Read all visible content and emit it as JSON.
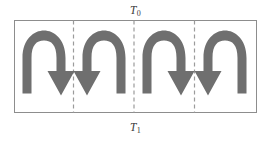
{
  "figure": {
    "type": "diagram",
    "canvas": {
      "width": 271,
      "height": 141,
      "background": "#ffffff"
    }
  },
  "labels": {
    "top": {
      "symbol": "T",
      "subscript": "0",
      "text": "T0",
      "position": "above-box",
      "align": "center"
    },
    "bottom": {
      "symbol": "T",
      "subscript": "1",
      "text": "T1",
      "position": "below-box",
      "align": "center"
    }
  },
  "enclosure": {
    "name": "fluid-layer-box",
    "x": 14,
    "y": 20,
    "width": 243,
    "height": 93,
    "border_color": "#8d8d8d",
    "border_width": 1,
    "fill": "#ffffff"
  },
  "dividers": {
    "style": "dashed",
    "color": "#9b9b9b",
    "width": 1.2,
    "dash_pattern": "4,3",
    "x_positions": [
      73.5,
      134.0,
      194.5
    ],
    "y_top": 20,
    "y_bottom": 113
  },
  "arrows": {
    "fill_color": "#6f6f6f",
    "count": 4,
    "description": "arched convection roll arrows, alternating circulation direction",
    "items": [
      {
        "name": "convection-arrow-1",
        "cell": 1,
        "head_side": "right",
        "direction": "clockwise",
        "center_x": 44,
        "top_y": 37,
        "bottom_y": 95
      },
      {
        "name": "convection-arrow-2",
        "cell": 2,
        "head_side": "left",
        "direction": "counterclockwise",
        "center_x": 104,
        "top_y": 37,
        "bottom_y": 95
      },
      {
        "name": "convection-arrow-3",
        "cell": 3,
        "head_side": "right",
        "direction": "clockwise",
        "center_x": 164,
        "top_y": 37,
        "bottom_y": 95
      },
      {
        "name": "convection-arrow-4",
        "cell": 4,
        "head_side": "left",
        "direction": "counterclockwise",
        "center_x": 225,
        "top_y": 37,
        "bottom_y": 95
      }
    ]
  },
  "colors": {
    "arrow_gray": "#6f6f6f",
    "border_gray": "#8d8d8d",
    "dashed_gray": "#9b9b9b",
    "text_gray": "#3a3a3a",
    "background": "#ffffff"
  }
}
